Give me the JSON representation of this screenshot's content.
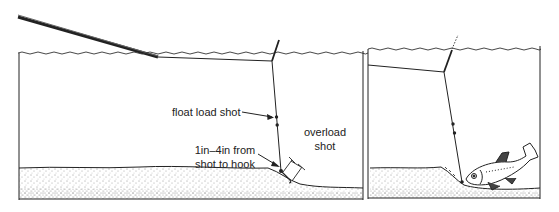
{
  "diagram": {
    "type": "fishing float rig illustration",
    "panels": [
      {
        "id": "left",
        "labels": {
          "float_load_shot": "float load shot",
          "overload_shot_line1": "overload",
          "overload_shot_line2": "shot",
          "distance_line1": "1in–4in from",
          "distance_line2": "shot to hook"
        }
      },
      {
        "id": "right",
        "labels": {}
      }
    ],
    "colors": {
      "ink": "#222222",
      "background": "#ffffff"
    }
  }
}
